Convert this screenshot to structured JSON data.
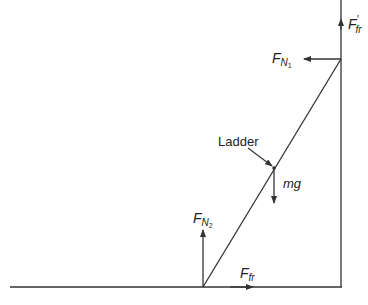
{
  "diagram": {
    "labels": {
      "ladder": "Ladder",
      "weight": "mg",
      "wall_friction_main": "F",
      "wall_friction_sub": "fr",
      "wall_friction_prime": "′",
      "wall_normal_main": "F",
      "wall_normal_sub": "N",
      "wall_normal_subsub": "1",
      "floor_normal_main": "F",
      "floor_normal_sub": "N",
      "floor_normal_subsub": "2",
      "floor_friction_main": "F",
      "floor_friction_sub": "fr"
    },
    "colors": {
      "line": "#333333"
    }
  }
}
